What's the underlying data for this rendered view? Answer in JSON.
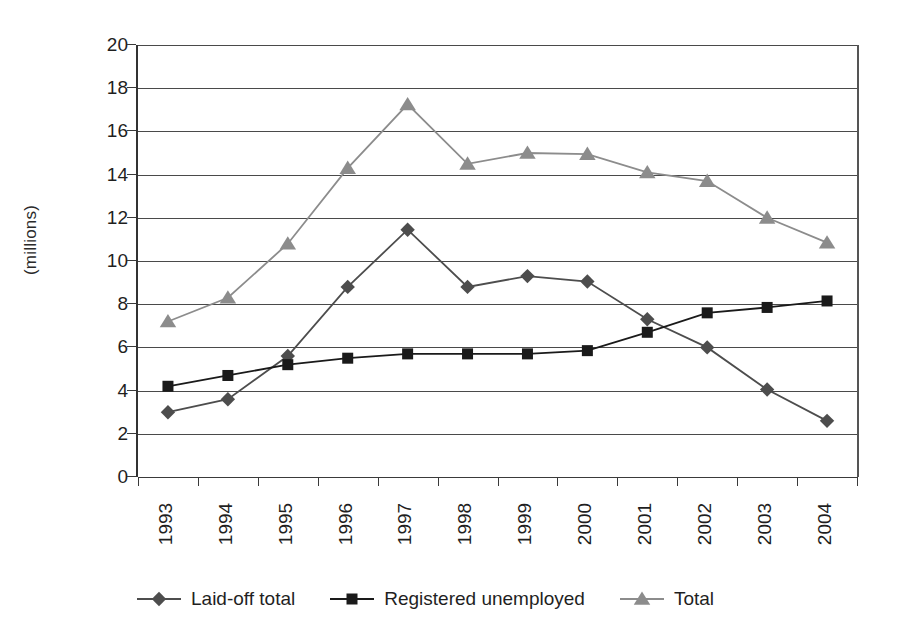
{
  "chart_data": {
    "type": "line",
    "title": "",
    "subtitle": "",
    "xlabel": "",
    "ylabel": "(millions)",
    "categories": [
      "1993",
      "1994",
      "1995",
      "1996",
      "1997",
      "1998",
      "1999",
      "2000",
      "2001",
      "2002",
      "2003",
      "2004"
    ],
    "ylim": [
      0,
      20
    ],
    "ytick_step": 2,
    "yticks": [
      "0",
      "2",
      "4",
      "6",
      "8",
      "10",
      "12",
      "14",
      "16",
      "18",
      "20"
    ],
    "grid": true,
    "legend_position": "bottom",
    "series": [
      {
        "name": "Laid-off total",
        "marker": "diamond",
        "color": "#4d4d4d",
        "values": [
          3.0,
          3.6,
          5.6,
          8.8,
          11.45,
          8.8,
          9.3,
          9.05,
          7.3,
          6.0,
          4.05,
          2.6
        ]
      },
      {
        "name": "Registered unemployed",
        "marker": "square",
        "color": "#1a1a1a",
        "values": [
          4.2,
          4.7,
          5.2,
          5.5,
          5.7,
          5.7,
          5.7,
          5.85,
          6.7,
          7.6,
          7.85,
          8.15
        ]
      },
      {
        "name": "Total",
        "marker": "triangle",
        "color": "#8c8c8c",
        "values": [
          7.2,
          8.3,
          10.8,
          14.3,
          17.25,
          14.5,
          15.0,
          14.95,
          14.1,
          13.7,
          12.0,
          10.85
        ]
      }
    ]
  },
  "legend": {
    "entries": [
      {
        "label": "Laid-off total",
        "marker": "diamond-marker-icon"
      },
      {
        "label": "Registered unemployed",
        "marker": "square-marker-icon"
      },
      {
        "label": "Total",
        "marker": "triangle-marker-icon"
      }
    ]
  },
  "axes": {
    "y_title": "(millions)"
  }
}
